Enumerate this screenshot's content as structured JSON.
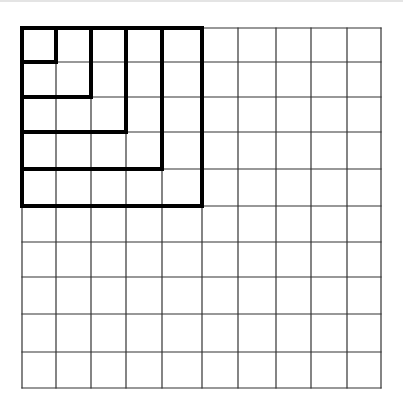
{
  "diagram": {
    "grid": {
      "rows": 10,
      "cols": 10,
      "x_lines": [
        22,
        56,
        91,
        126,
        162,
        202,
        238,
        276,
        311,
        347,
        381
      ],
      "y_lines": [
        28,
        62,
        97,
        132,
        169,
        206,
        242,
        277,
        314,
        352,
        388
      ],
      "line_color": "#333333",
      "line_width": 1.2
    },
    "bold_squares": [
      {
        "size": 1
      },
      {
        "size": 2
      },
      {
        "size": 3
      },
      {
        "size": 4
      },
      {
        "size": 5
      }
    ],
    "bold_color": "#000000",
    "bold_width": 4
  }
}
